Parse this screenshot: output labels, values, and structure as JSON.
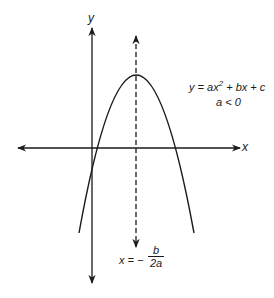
{
  "diagram": {
    "axes": {
      "x_label": "x",
      "y_label": "y"
    },
    "equation": {
      "line1_prefix": "y = ax",
      "line1_exponent": "2",
      "line1_suffix": " + bx + c",
      "line2": "a < 0"
    },
    "axis_of_symmetry": {
      "lhs": "x = −",
      "numerator": "b",
      "denominator": "2a"
    },
    "colors": {
      "stroke": "#1a1a1a",
      "background": "#ffffff"
    }
  }
}
